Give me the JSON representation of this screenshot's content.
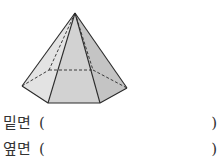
{
  "figure": {
    "shape": "hexagonal-pyramid",
    "colors": {
      "edge": "#2a2a2a",
      "face_light": "#e0e0e0",
      "face_mid": "#cfcfcf",
      "face_dark": "#bdbdbd"
    }
  },
  "questions": [
    {
      "label": "밑면",
      "open_paren": "(",
      "answer": "",
      "close_paren": ")"
    },
    {
      "label": "옆면",
      "open_paren": "(",
      "answer": "",
      "close_paren": ")"
    }
  ]
}
